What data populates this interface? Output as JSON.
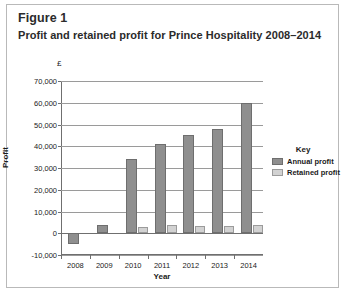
{
  "figure": {
    "label": "Figure 1",
    "title": "Profit and retained profit for Prince Hospitality 2008–2014"
  },
  "chart_data": {
    "type": "bar",
    "title": "Profit and retained profit for Prince Hospitality 2008–2014",
    "xlabel": "Year",
    "ylabel": "Profit",
    "currency_symbol": "£",
    "categories": [
      "2008",
      "2009",
      "2010",
      "2011",
      "2012",
      "2013",
      "2014"
    ],
    "series": [
      {
        "name": "Annual profit",
        "color": "#8f8f8f",
        "values": [
          -5000,
          4000,
          34000,
          41000,
          45000,
          48000,
          60000
        ]
      },
      {
        "name": "Retained profit",
        "color": "#d2d2d2",
        "values": [
          0,
          0,
          3000,
          4000,
          3500,
          3500,
          4000
        ]
      }
    ],
    "ylim": [
      -10000,
      70000
    ],
    "yticks": [
      {
        "value": 70000,
        "label": "70,000"
      },
      {
        "value": 60000,
        "label": "60,000"
      },
      {
        "value": 50000,
        "label": "50,000"
      },
      {
        "value": 40000,
        "label": "40,000"
      },
      {
        "value": 30000,
        "label": "30,000"
      },
      {
        "value": 20000,
        "label": "20,000"
      },
      {
        "value": 10000,
        "label": "10,000"
      },
      {
        "value": 0,
        "label": "0"
      },
      {
        "value": -10000,
        "label": "-10,000"
      }
    ],
    "grid": true,
    "legend_position": "right",
    "legend_title": "Key"
  }
}
